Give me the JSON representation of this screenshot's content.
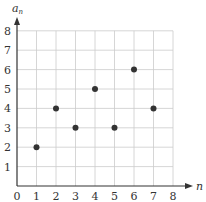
{
  "chart_data": {
    "type": "scatter",
    "title": "",
    "xlabel": "n",
    "ylabel": "a_n",
    "x": [
      1,
      2,
      3,
      4,
      5,
      6,
      7
    ],
    "y": [
      2,
      4,
      3,
      5,
      3,
      6,
      4
    ],
    "xlim": [
      0,
      8
    ],
    "ylim": [
      0,
      8
    ],
    "xticks": [
      "0",
      "1",
      "2",
      "3",
      "4",
      "5",
      "6",
      "7",
      "8"
    ],
    "yticks": [
      "1",
      "2",
      "3",
      "4",
      "5",
      "6",
      "7",
      "8"
    ],
    "grid": true,
    "legend": null
  },
  "labels": {
    "x_axis": "n",
    "y_axis_main": "a",
    "y_axis_sub": "n",
    "origin": "0"
  },
  "colors": {
    "axis": "#333333",
    "grid": "#cccccc",
    "point": "#333333"
  }
}
